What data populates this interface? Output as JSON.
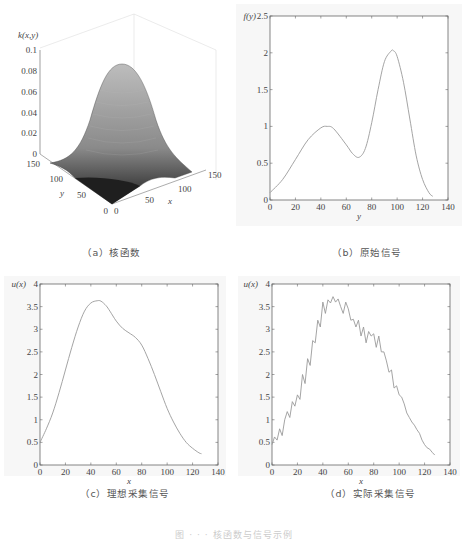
{
  "captions": {
    "a": "（a）核函数",
    "b": "（b）原始信号",
    "c": "（c）理想采集信号",
    "d": "（d）实际采集信号",
    "figure": "图 · · · 核函数与信号示例"
  },
  "chart_data": [
    {
      "id": "a",
      "type": "surface3d",
      "title": "",
      "zlabel": "k(x,y)",
      "xlabel": "x",
      "ylabel": "y",
      "x_ticks": [
        0,
        50,
        100,
        150
      ],
      "y_ticks": [
        0,
        50,
        100,
        150
      ],
      "z_ticks": [
        0,
        0.02,
        0.04,
        0.06,
        0.08,
        0.1
      ],
      "zlim": [
        0,
        0.1
      ],
      "description": "2D Gaussian kernel centered near (64,64), peak ≈ 0.085",
      "peak": 0.085
    },
    {
      "id": "b",
      "type": "line",
      "ylabel": "f(y)",
      "xlabel": "y",
      "xlim": [
        0,
        140
      ],
      "ylim": [
        0,
        2.5
      ],
      "x_ticks": [
        0,
        20,
        40,
        60,
        80,
        100,
        120,
        140
      ],
      "y_ticks": [
        0,
        0.5,
        1,
        1.5,
        2,
        2.5
      ],
      "x": [
        0,
        10,
        20,
        30,
        40,
        45,
        50,
        60,
        65,
        70,
        75,
        80,
        85,
        90,
        95,
        97,
        100,
        105,
        110,
        115,
        120,
        125,
        128
      ],
      "values": [
        0.1,
        0.28,
        0.55,
        0.82,
        0.98,
        1.0,
        0.97,
        0.75,
        0.63,
        0.58,
        0.7,
        1.05,
        1.5,
        1.88,
        2.02,
        2.03,
        1.95,
        1.6,
        1.1,
        0.6,
        0.28,
        0.1,
        0.05
      ]
    },
    {
      "id": "c",
      "type": "line",
      "ylabel": "u(x)",
      "xlabel": "x",
      "xlim": [
        0,
        140
      ],
      "ylim": [
        0,
        4
      ],
      "x_ticks": [
        0,
        20,
        40,
        60,
        80,
        100,
        120,
        140
      ],
      "y_ticks": [
        0,
        0.5,
        1,
        1.5,
        2,
        2.5,
        3,
        3.5,
        4
      ],
      "x": [
        0,
        5,
        10,
        15,
        20,
        25,
        30,
        35,
        40,
        45,
        48,
        52,
        55,
        60,
        65,
        70,
        75,
        80,
        85,
        90,
        95,
        100,
        105,
        110,
        115,
        120,
        125,
        127
      ],
      "values": [
        0.5,
        0.8,
        1.15,
        1.6,
        2.1,
        2.6,
        3.05,
        3.4,
        3.58,
        3.63,
        3.62,
        3.52,
        3.4,
        3.18,
        3.02,
        2.92,
        2.82,
        2.65,
        2.35,
        2.0,
        1.62,
        1.25,
        0.95,
        0.7,
        0.5,
        0.37,
        0.27,
        0.25
      ]
    },
    {
      "id": "d",
      "type": "line",
      "ylabel": "u(x)",
      "xlabel": "x",
      "xlim": [
        0,
        140
      ],
      "ylim": [
        0,
        4
      ],
      "x_ticks": [
        0,
        20,
        40,
        60,
        80,
        100,
        120,
        140
      ],
      "y_ticks": [
        0,
        0.5,
        1,
        1.5,
        2,
        2.5,
        3,
        3.5,
        4
      ],
      "description": "noisy version of (c)",
      "x": [
        0,
        2,
        4,
        6,
        8,
        10,
        12,
        14,
        16,
        18,
        20,
        22,
        24,
        26,
        28,
        30,
        32,
        34,
        36,
        38,
        40,
        42,
        44,
        46,
        48,
        50,
        52,
        54,
        56,
        58,
        60,
        62,
        64,
        66,
        68,
        70,
        72,
        74,
        76,
        78,
        80,
        82,
        84,
        86,
        88,
        90,
        92,
        94,
        96,
        98,
        100,
        102,
        104,
        106,
        108,
        110,
        112,
        114,
        116,
        118,
        120,
        122,
        124,
        126,
        128
      ],
      "values": [
        0.45,
        0.62,
        0.55,
        0.8,
        0.65,
        1.0,
        1.18,
        1.05,
        1.4,
        1.3,
        1.55,
        1.45,
        2.0,
        1.8,
        2.35,
        2.2,
        2.75,
        2.7,
        3.2,
        3.05,
        3.6,
        3.35,
        3.65,
        3.58,
        3.72,
        3.6,
        3.67,
        3.5,
        3.35,
        3.6,
        3.45,
        3.2,
        3.22,
        3.05,
        3.2,
        2.85,
        3.05,
        2.7,
        2.95,
        2.85,
        2.9,
        2.6,
        2.85,
        2.5,
        2.5,
        2.3,
        2.05,
        2.1,
        1.7,
        1.75,
        1.55,
        1.5,
        1.35,
        1.15,
        1.05,
        0.95,
        0.88,
        0.78,
        0.7,
        0.55,
        0.45,
        0.38,
        0.35,
        0.28,
        0.22
      ]
    }
  ]
}
